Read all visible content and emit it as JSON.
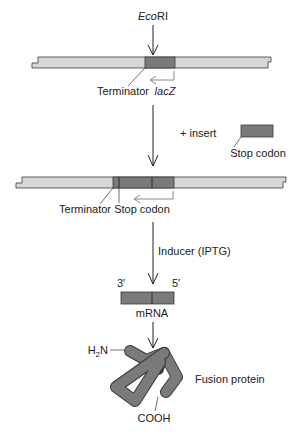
{
  "top_section": {
    "enzyme_label_italic": "Eco",
    "enzyme_label_rest": "RI",
    "terminator_label": "Terminator",
    "gene_label": "lacZ"
  },
  "insert_step": {
    "plus_insert_label": "+ insert",
    "insert_label": "Stop codon"
  },
  "middle_section": {
    "terminator_label": "Terminator",
    "stop_codon_label": "Stop codon"
  },
  "induction_step": {
    "inducer_label": "Inducer (IPTG)"
  },
  "mrna": {
    "left_end": "3′",
    "right_end": "5′",
    "label": "mRNA"
  },
  "protein": {
    "n_terminus_pre": "H",
    "n_terminus_sub": "2",
    "n_terminus_post": "N",
    "c_terminus": "COOH",
    "label": "Fusion protein"
  },
  "colors": {
    "vector_fill": "#d6d6d6",
    "insert_fill": "#7a7a7a",
    "outline": "#3a3a3a",
    "arrow_gray": "#888888"
  }
}
